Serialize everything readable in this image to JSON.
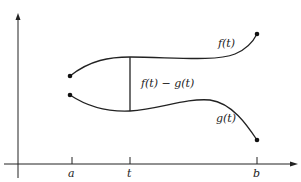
{
  "diagram": {
    "curves": {
      "f_label": "f(t)",
      "g_label": "g(t)",
      "diff_label": "f(t) − g(t)"
    },
    "ticks": {
      "a": "a",
      "t": "t",
      "b": "b"
    },
    "colors": {
      "stroke": "#222222",
      "background": "#ffffff"
    }
  }
}
